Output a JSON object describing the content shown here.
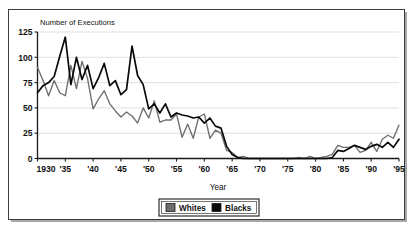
{
  "chart_data": {
    "type": "line",
    "title": "",
    "ylabel": "Number of Executions",
    "xlabel": "Year",
    "ylim": [
      0,
      125
    ],
    "xlim": [
      1930,
      1995
    ],
    "grid": true,
    "legend_position": "bottom",
    "y_ticks": [
      "0",
      "25",
      "50",
      "75",
      "100",
      "125"
    ],
    "y_tick_values": [
      0,
      25,
      50,
      75,
      100,
      125
    ],
    "x_ticks": [
      "1930",
      "'35",
      "'40",
      "'45",
      "'50",
      "'55",
      "'60",
      "'65",
      "'70",
      "'75",
      "'80",
      "'85",
      "'90",
      "'95"
    ],
    "x_tick_values": [
      1930,
      1935,
      1940,
      1945,
      1950,
      1955,
      1960,
      1965,
      1970,
      1975,
      1980,
      1985,
      1990,
      1995
    ],
    "x": [
      1930,
      1931,
      1932,
      1933,
      1934,
      1935,
      1936,
      1937,
      1938,
      1939,
      1940,
      1941,
      1942,
      1943,
      1944,
      1945,
      1946,
      1947,
      1948,
      1949,
      1950,
      1951,
      1952,
      1953,
      1954,
      1955,
      1956,
      1957,
      1958,
      1959,
      1960,
      1961,
      1962,
      1963,
      1964,
      1965,
      1966,
      1967,
      1968,
      1969,
      1970,
      1971,
      1972,
      1973,
      1974,
      1975,
      1976,
      1977,
      1978,
      1979,
      1980,
      1981,
      1982,
      1983,
      1984,
      1985,
      1986,
      1987,
      1988,
      1989,
      1990,
      1991,
      1992,
      1993,
      1994,
      1995
    ],
    "series": [
      {
        "name": "Whites",
        "color": "#6e6e6e",
        "values": [
          90,
          77,
          62,
          77,
          65,
          62,
          92,
          69,
          96,
          79,
          49,
          59,
          67,
          54,
          47,
          41,
          46,
          42,
          35,
          50,
          40,
          57,
          36,
          38,
          38,
          44,
          21,
          34,
          20,
          41,
          44,
          20,
          28,
          25,
          8,
          6,
          1,
          2,
          0,
          0,
          0,
          0,
          0,
          0,
          0,
          0,
          0,
          1,
          0,
          2,
          0,
          1,
          2,
          4,
          13,
          11,
          11,
          13,
          6,
          8,
          16,
          7,
          19,
          23,
          20,
          33
        ],
        "values_note": "gray line"
      },
      {
        "name": "Blacks",
        "color": "#0a0a0a",
        "values": [
          65,
          72,
          75,
          81,
          101,
          120,
          73,
          100,
          78,
          92,
          69,
          80,
          94,
          72,
          77,
          63,
          68,
          111,
          82,
          73,
          49,
          54,
          45,
          54,
          41,
          45,
          43,
          42,
          40,
          41,
          35,
          40,
          32,
          30,
          12,
          4,
          1,
          0,
          0,
          0,
          0,
          0,
          0,
          0,
          0,
          0,
          0,
          0,
          0,
          0,
          0,
          0,
          0,
          1,
          8,
          7,
          10,
          13,
          11,
          9,
          12,
          14,
          11,
          16,
          11,
          19
        ],
        "values_note": "black line"
      }
    ]
  },
  "legend": {
    "entries": [
      {
        "label": "Whites",
        "swatch": "#6e6e6e"
      },
      {
        "label": "Blacks",
        "swatch": "#0a0a0a"
      }
    ]
  }
}
